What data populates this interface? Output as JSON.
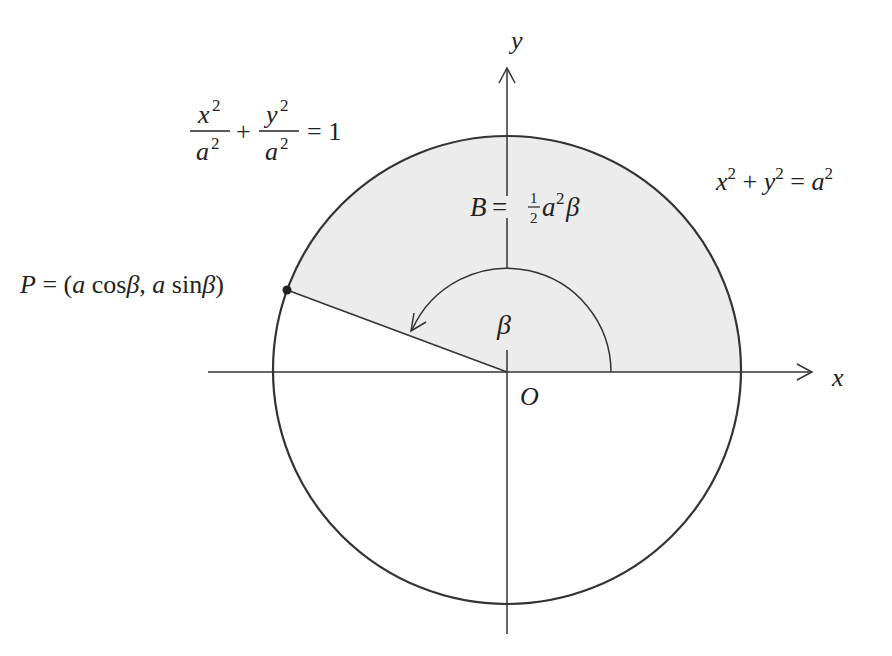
{
  "figure": {
    "colors": {
      "stroke": "#333333",
      "shade": "#ececec",
      "background": "#ffffff"
    },
    "axes": {
      "x_label": "x",
      "y_label": "y",
      "origin_label": "O"
    },
    "labels": {
      "ellipse_eq": {
        "x_num": "x",
        "x_exp": "2",
        "x_den": "a",
        "x_den_exp": "2",
        "plus": "+",
        "y_num": "y",
        "y_exp": "2",
        "y_den": "a",
        "y_den_exp": "2",
        "rhs": "= 1"
      },
      "circle_eq": {
        "x": "x",
        "x_exp": "2",
        "plus": " + ",
        "y": "y",
        "y_exp": "2",
        "eq": " = ",
        "a": "a",
        "a_exp": "2"
      },
      "area": {
        "B": "B",
        "eq": " = ",
        "half_num": "1",
        "half_den": "2",
        "a": "a",
        "a_exp": "2",
        "beta": "β"
      },
      "angle": "β",
      "point": {
        "P": "P",
        "eq": " = (",
        "a1": "a",
        "cos": " cos",
        "beta1": "β",
        "comma": ", ",
        "a2": "a",
        "sin": " sin",
        "beta2": "β",
        "close": ")"
      }
    },
    "geometry": {
      "center": [
        507,
        370
      ],
      "radius": 234,
      "angle_beta_deg": 160
    }
  }
}
